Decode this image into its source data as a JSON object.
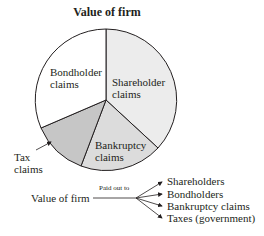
{
  "title": "Value of firm",
  "pie": {
    "slices": [
      {
        "label_line1": "Shareholder",
        "label_line2": "claims",
        "color": "#ececec"
      },
      {
        "label_line1": "Bankruptcy",
        "label_line2": "claims",
        "color": "#dcdcdc"
      },
      {
        "label_line1": "Tax",
        "label_line2": "claims",
        "color": "#c6c6c6"
      },
      {
        "label_line1": "Bondholder",
        "label_line2": "claims",
        "color": "#ffffff"
      }
    ]
  },
  "flow": {
    "source": "Value of firm",
    "connector_label": "Paid out to",
    "targets": [
      "Shareholders",
      "Bondholders",
      "Bankruptcy claims",
      "Taxes (government)"
    ]
  }
}
